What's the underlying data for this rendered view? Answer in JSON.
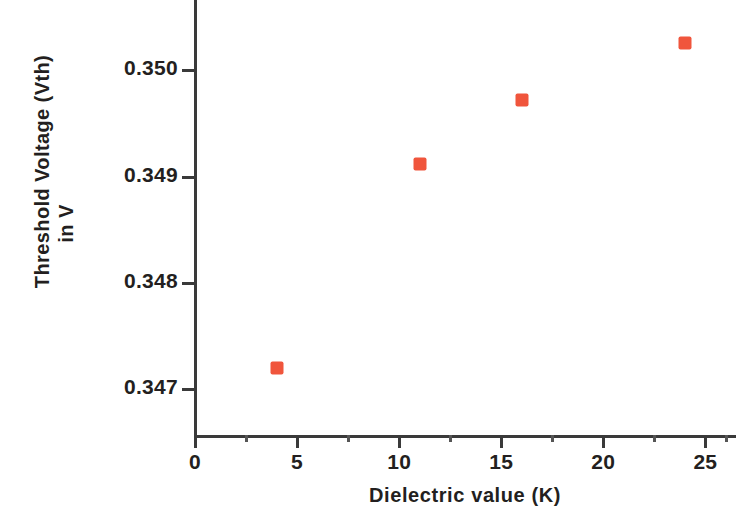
{
  "chart_data": {
    "type": "scatter",
    "title": "",
    "xlabel": "Dielectric value (K)",
    "ylabel_line1": "Threshold Voltage (Vth)",
    "ylabel_line2": "in V",
    "x": [
      4,
      11,
      16,
      24
    ],
    "values": [
      0.3472,
      0.34912,
      0.34972,
      0.35026
    ],
    "series": [
      {
        "name": "Threshold Voltage",
        "marker": "square",
        "color": "#F0553C",
        "points": [
          {
            "x": 4,
            "y": 0.3472
          },
          {
            "x": 11,
            "y": 0.34912
          },
          {
            "x": 16,
            "y": 0.34972
          },
          {
            "x": 24,
            "y": 0.35026
          }
        ]
      }
    ],
    "xlim": [
      0,
      26.5
    ],
    "ylim": [
      0.34655,
      0.35055
    ],
    "xticks": [
      0,
      5,
      10,
      15,
      20,
      25
    ],
    "xtick_labels": [
      "0",
      "5",
      "10",
      "15",
      "20",
      "25"
    ],
    "xminor_ticks": [
      2.5,
      7.5,
      12.5,
      17.5,
      22.5,
      26
    ],
    "yticks": [
      0.347,
      0.348,
      0.349,
      0.35
    ],
    "ytick_labels": [
      "0.347",
      "0.348",
      "0.349",
      "0.350"
    ],
    "grid": false,
    "legend": null,
    "axis_color": "#3a3a3a",
    "text_color": "#231f20",
    "background": "#ffffff"
  }
}
